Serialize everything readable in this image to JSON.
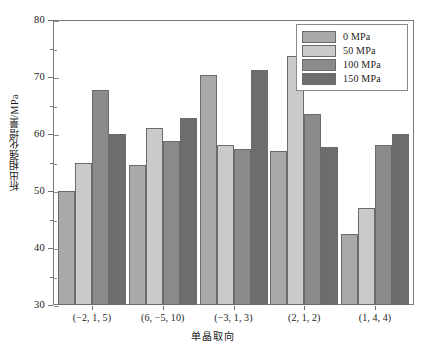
{
  "chart_data": {
    "type": "bar",
    "title": "",
    "xlabel": "单晶取向",
    "ylabel": "析出相强化增量/MPa",
    "ylim": [
      30,
      80
    ],
    "ytick_step": 10,
    "yminor_step": 5,
    "grid": false,
    "legend_position": "top-right",
    "categories": [
      "(−2, 1, 5)",
      "(6, −5, 10)",
      "(−3, 1, 3)",
      "(2, 1, 2)",
      "(1, 4, 4)"
    ],
    "series": [
      {
        "name": "0 MPa",
        "color": "#a9a9a9",
        "values": [
          50.0,
          54.5,
          70.3,
          57.0,
          42.5
        ]
      },
      {
        "name": "50 MPa",
        "color": "#cacaca",
        "values": [
          55.0,
          61.0,
          58.0,
          73.7,
          47.0
        ]
      },
      {
        "name": "100 MPa",
        "color": "#8b8b8b",
        "values": [
          67.8,
          58.8,
          57.3,
          63.5,
          58.0
        ]
      },
      {
        "name": "150 MPa",
        "color": "#6d6d6d",
        "values": [
          60.0,
          62.8,
          71.2,
          57.8,
          60.0
        ]
      }
    ],
    "ytick_labels": [
      "80",
      "70",
      "60",
      "50",
      "40",
      "30"
    ],
    "ytick_values": [
      80,
      70,
      60,
      50,
      40,
      30
    ]
  },
  "legend": {
    "items": [
      {
        "label": "0 MPa",
        "swatch": "#a9a9a9"
      },
      {
        "label": "50 MPa",
        "swatch": "#cacaca"
      },
      {
        "label": "100 MPa",
        "swatch": "#8b8b8b"
      },
      {
        "label": "150 MPa",
        "swatch": "#6d6d6d"
      }
    ]
  },
  "axes": {
    "y_title": "析出相强化增量/MPa",
    "x_title": "单晶取向"
  }
}
